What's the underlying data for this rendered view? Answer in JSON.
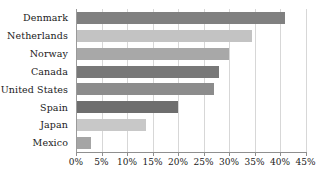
{
  "chart_data": {
    "type": "bar",
    "orientation": "horizontal",
    "title": "",
    "subtitle": "",
    "xlabel": "",
    "ylabel": "",
    "categories": [
      "Denmark",
      "Netherlands",
      "Norway",
      "Canada",
      "United States",
      "Spain",
      "Japan",
      "Mexico"
    ],
    "values": [
      41.0,
      34.5,
      30.0,
      28.0,
      27.0,
      20.0,
      13.8,
      3.0
    ],
    "value_suffix": "%",
    "xlim": [
      0,
      45
    ],
    "xticks": [
      0,
      5,
      10,
      15,
      20,
      25,
      30,
      35,
      40,
      45
    ],
    "xtick_labels": [
      "0%",
      "5%",
      "10%",
      "15%",
      "20%",
      "25%",
      "30%",
      "35%",
      "40%",
      "45%"
    ],
    "grid": true,
    "grid_axis": "x",
    "legend": false,
    "bar_colors": [
      "#808080",
      "#c3c3c3",
      "#a8a8a8",
      "#787878",
      "#8c8c8c",
      "#6e6e6e",
      "#c8c8c8",
      "#a5a5a5"
    ],
    "grid_color": "#d7d7d7",
    "axis_color": "#8f8f8f",
    "background_color": "#ffffff",
    "text_color": "#1a1a1a"
  }
}
